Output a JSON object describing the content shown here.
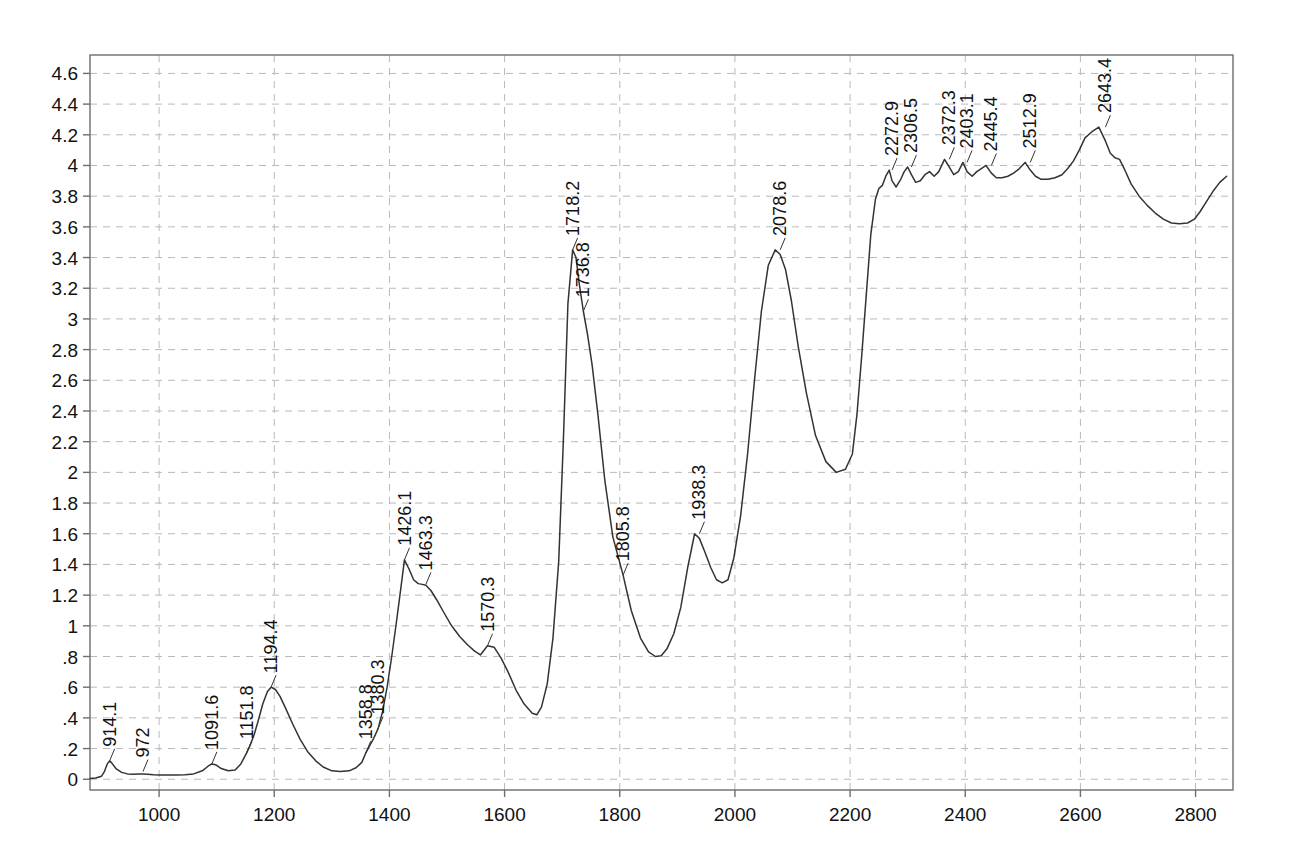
{
  "chart_data": {
    "type": "line",
    "title": "",
    "subtitle": "",
    "xlabel": "",
    "ylabel": "",
    "xlim": [
      880,
      2865
    ],
    "ylim": [
      -0.07,
      4.72
    ],
    "grid": true,
    "legend_position": "none",
    "xticks": [
      1000,
      1200,
      1400,
      1600,
      1800,
      2000,
      2200,
      2400,
      2600,
      2800
    ],
    "xtick_labels": [
      "1000",
      "1200",
      "1400",
      "1600",
      "1800",
      "2000",
      "2200",
      "2400",
      "2600",
      "2800"
    ],
    "yticks": [
      0,
      0.2,
      0.4,
      0.6,
      0.8,
      1,
      1.2,
      1.4,
      1.6,
      1.8,
      2,
      2.2,
      2.4,
      2.6,
      2.8,
      3,
      3.2,
      3.4,
      3.6,
      3.8,
      4,
      4.2,
      4.4,
      4.6
    ],
    "ytick_labels": [
      "0",
      ".2",
      ".4",
      ".6",
      ".8",
      "1",
      "1.2",
      "1.4",
      "1.6",
      "1.8",
      "2",
      "2.2",
      "2.4",
      "2.6",
      "2.8",
      "3",
      "3.2",
      "3.4",
      "3.6",
      "3.8",
      "4",
      "4.2",
      "4.4",
      "4.6"
    ],
    "line_color": "#333333",
    "grid_color": "#b9b9b9",
    "axis_color": "#6d6d6d",
    "annotations": [
      {
        "label": "914.1",
        "x": 914.1,
        "y": 0.12
      },
      {
        "label": "972",
        "x": 972.0,
        "y": 0.05
      },
      {
        "label": "1091.6",
        "x": 1091.6,
        "y": 0.1
      },
      {
        "label": "1151.8",
        "x": 1151.8,
        "y": 0.17
      },
      {
        "label": "1194.4",
        "x": 1194.4,
        "y": 0.6
      },
      {
        "label": "1358.8",
        "x": 1358.8,
        "y": 0.17
      },
      {
        "label": "1380.3",
        "x": 1380.3,
        "y": 0.33
      },
      {
        "label": "1426.1",
        "x": 1426.1,
        "y": 1.43
      },
      {
        "label": "1463.3",
        "x": 1463.3,
        "y": 1.27
      },
      {
        "label": "1570.3",
        "x": 1570.3,
        "y": 0.87
      },
      {
        "label": "1718.2",
        "x": 1718.2,
        "y": 3.45
      },
      {
        "label": "1736.8",
        "x": 1736.8,
        "y": 3.05
      },
      {
        "label": "1805.8",
        "x": 1805.8,
        "y": 1.33
      },
      {
        "label": "1938.3",
        "x": 1938.3,
        "y": 1.6
      },
      {
        "label": "2078.6",
        "x": 2078.6,
        "y": 3.45
      },
      {
        "label": "2272.9",
        "x": 2272.9,
        "y": 3.97
      },
      {
        "label": "2306.5",
        "x": 2306.5,
        "y": 3.99
      },
      {
        "label": "2372.3",
        "x": 2372.3,
        "y": 4.04
      },
      {
        "label": "2403.1",
        "x": 2403.1,
        "y": 4.02
      },
      {
        "label": "2445.4",
        "x": 2445.4,
        "y": 4.0
      },
      {
        "label": "2512.9",
        "x": 2512.9,
        "y": 4.02
      },
      {
        "label": "2643.4",
        "x": 2643.4,
        "y": 4.25
      }
    ],
    "x": [
      880,
      890,
      900,
      905,
      910,
      914,
      918,
      925,
      935,
      945,
      955,
      965,
      972,
      980,
      990,
      1000,
      1015,
      1030,
      1045,
      1060,
      1075,
      1085,
      1091.6,
      1098,
      1108,
      1120,
      1132,
      1142,
      1151.8,
      1158,
      1165,
      1172,
      1180,
      1188,
      1194.4,
      1202,
      1210,
      1220,
      1232,
      1245,
      1258,
      1272,
      1285,
      1300,
      1315,
      1330,
      1342,
      1352,
      1358.8,
      1366,
      1373,
      1380.3,
      1388,
      1396,
      1404,
      1412,
      1420,
      1426.1,
      1434,
      1442,
      1450,
      1457,
      1463.3,
      1472,
      1482,
      1494,
      1508,
      1522,
      1536,
      1548,
      1558,
      1570.3,
      1582,
      1594,
      1606,
      1620,
      1634,
      1648,
      1656,
      1664,
      1674,
      1684,
      1694,
      1702,
      1710,
      1718.2,
      1724,
      1730,
      1736.8,
      1744,
      1752,
      1762,
      1774,
      1788,
      1805.8,
      1820,
      1836,
      1850,
      1862,
      1872,
      1882,
      1894,
      1906,
      1918,
      1930,
      1938.3,
      1948,
      1958,
      1968,
      1978,
      1988,
      1998,
      2010,
      2022,
      2034,
      2046,
      2058,
      2070,
      2078.6,
      2088,
      2098,
      2110,
      2124,
      2140,
      2158,
      2176,
      2192,
      2204,
      2212,
      2220,
      2228,
      2236,
      2244,
      2250,
      2256,
      2262,
      2268,
      2272.9,
      2280,
      2288,
      2294,
      2300,
      2306.5,
      2314,
      2322,
      2330,
      2338,
      2346,
      2354,
      2364,
      2372.3,
      2380,
      2388,
      2396,
      2403.1,
      2412,
      2420,
      2428,
      2436,
      2445.4,
      2454,
      2464,
      2474,
      2484,
      2494,
      2504,
      2512.9,
      2522,
      2532,
      2544,
      2556,
      2568,
      2578,
      2588,
      2598,
      2608,
      2620,
      2632,
      2643.4,
      2652,
      2660,
      2668,
      2676,
      2688,
      2702,
      2716,
      2730,
      2744,
      2758,
      2772,
      2786,
      2798,
      2808,
      2818,
      2830,
      2842,
      2854,
      2865
    ],
    "y": [
      0.005,
      0.008,
      0.02,
      0.05,
      0.1,
      0.12,
      0.105,
      0.07,
      0.045,
      0.035,
      0.033,
      0.034,
      0.035,
      0.033,
      0.03,
      0.028,
      0.027,
      0.028,
      0.03,
      0.035,
      0.055,
      0.085,
      0.1,
      0.095,
      0.07,
      0.055,
      0.06,
      0.1,
      0.17,
      0.22,
      0.29,
      0.38,
      0.49,
      0.57,
      0.6,
      0.585,
      0.54,
      0.46,
      0.36,
      0.26,
      0.18,
      0.12,
      0.08,
      0.055,
      0.05,
      0.055,
      0.075,
      0.11,
      0.17,
      0.22,
      0.27,
      0.33,
      0.44,
      0.6,
      0.8,
      1.02,
      1.25,
      1.43,
      1.37,
      1.3,
      1.275,
      1.27,
      1.265,
      1.23,
      1.17,
      1.09,
      1.0,
      0.93,
      0.875,
      0.835,
      0.81,
      0.87,
      0.86,
      0.79,
      0.7,
      0.58,
      0.49,
      0.43,
      0.42,
      0.47,
      0.62,
      0.92,
      1.42,
      2.2,
      3.1,
      3.45,
      3.4,
      3.22,
      3.05,
      2.9,
      2.7,
      2.38,
      1.95,
      1.58,
      1.33,
      1.1,
      0.92,
      0.83,
      0.8,
      0.805,
      0.85,
      0.95,
      1.12,
      1.38,
      1.6,
      1.57,
      1.48,
      1.38,
      1.3,
      1.28,
      1.3,
      1.44,
      1.72,
      2.12,
      2.6,
      3.05,
      3.35,
      3.45,
      3.42,
      3.32,
      3.12,
      2.82,
      2.52,
      2.24,
      2.07,
      2.0,
      2.02,
      2.12,
      2.38,
      2.75,
      3.15,
      3.55,
      3.78,
      3.85,
      3.87,
      3.93,
      3.97,
      3.9,
      3.86,
      3.91,
      3.96,
      3.99,
      3.94,
      3.89,
      3.9,
      3.94,
      3.96,
      3.93,
      3.96,
      4.04,
      3.99,
      3.94,
      3.96,
      4.02,
      3.96,
      3.93,
      3.96,
      3.98,
      4.0,
      3.95,
      3.92,
      3.92,
      3.93,
      3.95,
      3.98,
      4.02,
      3.97,
      3.93,
      3.91,
      3.91,
      3.92,
      3.94,
      3.98,
      4.03,
      4.1,
      4.18,
      4.22,
      4.25,
      4.16,
      4.08,
      4.05,
      4.04,
      3.98,
      3.88,
      3.8,
      3.74,
      3.69,
      3.65,
      3.625,
      3.62,
      3.625,
      3.65,
      3.7,
      3.76,
      3.83,
      3.89,
      3.93
    ]
  }
}
